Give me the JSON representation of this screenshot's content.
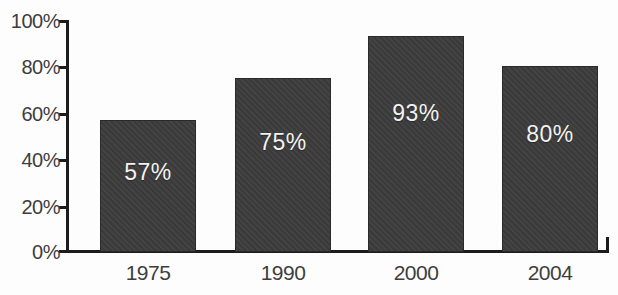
{
  "chart_data": {
    "type": "bar",
    "title": "",
    "subtitle": "",
    "xlabel": "",
    "ylabel": "",
    "categories": [
      "1975",
      "1990",
      "2000",
      "2004"
    ],
    "values": [
      57,
      75,
      93,
      80
    ],
    "value_labels": [
      "57%",
      "75%",
      "93%",
      "80%"
    ],
    "ylim": [
      0,
      100
    ],
    "y_ticks": [
      0,
      20,
      40,
      60,
      80,
      100
    ],
    "y_tick_labels": [
      "0%",
      "20%",
      "40%",
      "60%",
      "80%",
      "100%"
    ],
    "grid": false,
    "legend": false,
    "legend_position": "none",
    "orientation": "vertical",
    "series": [
      {
        "name": "",
        "values": [
          57,
          75,
          93,
          80
        ]
      }
    ]
  },
  "style": {
    "bar_color": "#3c3c3c",
    "bar_border_color": "#2a2a2a",
    "axis_color": "#1c1c1c",
    "value_label_color": "#f2f2f2",
    "tick_label_color": "#3d3d3d",
    "background": "#fdfdfd"
  }
}
